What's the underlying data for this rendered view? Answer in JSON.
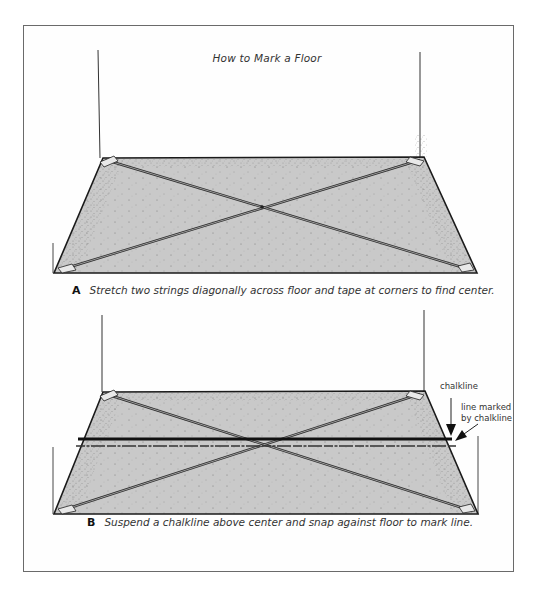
{
  "figure": {
    "title": "How to Mark a Floor",
    "panels": [
      {
        "id": "A",
        "letter": "A",
        "caption": "Stretch two strings diagonally across floor and tape at corners to find center.",
        "floor": {
          "top_left": [
            103,
            158
          ],
          "top_right": [
            424,
            157
          ],
          "bottom_right": [
            477,
            273
          ],
          "bottom_left": [
            54,
            273
          ]
        },
        "center": [
          262,
          207
        ]
      },
      {
        "id": "B",
        "letter": "B",
        "caption": "Suspend a chalkline above center and snap against floor to mark line.",
        "floor": {
          "top_left": [
            103,
            392
          ],
          "top_right": [
            425,
            391
          ],
          "bottom_right": [
            478,
            514
          ],
          "bottom_left": [
            54,
            514
          ]
        },
        "center": [
          266,
          446
        ],
        "callouts": {
          "chalkline": "chalkline",
          "marked_line_1": "line marked",
          "marked_line_2": "by chalkline"
        }
      }
    ],
    "colors": {
      "floor_fill": "#c8c8c8",
      "outline": "#1a1a1a",
      "frame": "#6a6a6a"
    }
  }
}
